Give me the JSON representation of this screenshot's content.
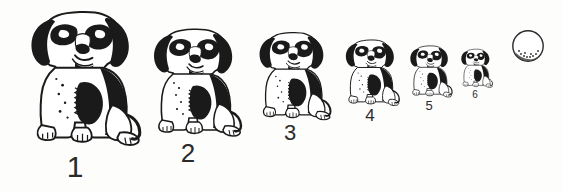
{
  "scene": {
    "title": "Sitting puppy size sequence",
    "background_color": "#fdfdfc",
    "ink_color": "#1a1a1a",
    "label_color": "#2b2b2b",
    "width": 563,
    "height": 192
  },
  "figures": [
    {
      "label": "1",
      "subject": "sitting-puppy",
      "x": 20,
      "y": 8,
      "width": 125,
      "height": 142,
      "label_x": 45,
      "label_y": 152,
      "label_width": 60,
      "label_font_size": 30
    },
    {
      "label": "2",
      "subject": "sitting-puppy",
      "x": 145,
      "y": 26,
      "width": 100,
      "height": 114,
      "label_x": 160,
      "label_y": 140,
      "label_width": 56,
      "label_font_size": 26
    },
    {
      "label": "3",
      "subject": "sitting-puppy",
      "x": 252,
      "y": 30,
      "width": 82,
      "height": 93,
      "label_x": 265,
      "label_y": 122,
      "label_width": 50,
      "label_font_size": 22
    },
    {
      "label": "4",
      "subject": "sitting-puppy",
      "x": 340,
      "y": 38,
      "width": 62,
      "height": 70,
      "label_x": 348,
      "label_y": 107,
      "label_width": 44,
      "label_font_size": 17
    },
    {
      "label": "5",
      "subject": "sitting-puppy",
      "x": 406,
      "y": 44,
      "width": 48,
      "height": 55,
      "label_x": 410,
      "label_y": 99,
      "label_width": 38,
      "label_font_size": 13
    },
    {
      "label": "6",
      "subject": "sitting-puppy",
      "x": 458,
      "y": 48,
      "width": 36,
      "height": 41,
      "label_x": 460,
      "label_y": 90,
      "label_width": 30,
      "label_font_size": 10
    }
  ],
  "ball": {
    "name": "shaded-sphere",
    "x": 511,
    "y": 29,
    "diameter": 34,
    "outline_color": "#2a2a2a",
    "fill_color": "#ffffff",
    "shadow_color": "#4a4a4a"
  }
}
